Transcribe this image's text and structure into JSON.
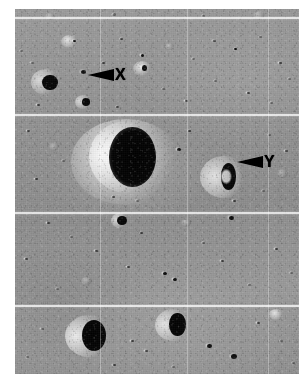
{
  "figure": {
    "kind": "lunar-surface-photograph",
    "tone": "grayscale",
    "background_color": "#ffffff",
    "plate_color": "#8e8e8e",
    "annotation_color": "#000000"
  },
  "annotations": [
    {
      "id": "x",
      "label": "X",
      "icon": "left-arrow-icon",
      "direction": "points-left",
      "target": "small dark crater in upper portion of image",
      "x_pct": 30.5,
      "y_pct": 15.5
    },
    {
      "id": "y",
      "label": "Y",
      "icon": "left-arrow-icon",
      "direction": "points-left",
      "target": "rimmed crater with crescent shadow, right of center",
      "x_pct": 79.0,
      "y_pct": 39.5
    }
  ],
  "seams": {
    "description": "white framelet seam lines from reconstructed orbital film strip",
    "color": "#ffffff",
    "horizontal_y_pct": [
      2.2,
      28.8,
      55.6,
      81.1
    ],
    "vertical_x_pct": [
      30.0,
      60.5,
      89.0
    ]
  },
  "features": {
    "major_craters": [
      {
        "name": "large-shadowed-crater",
        "x_pct": 38,
        "y_pct": 42,
        "size_pct": 25,
        "shadow": "deep-east-interior"
      },
      {
        "name": "crater-y",
        "x_pct": 74,
        "y_pct": 44,
        "size_pct": 16,
        "shadow": "crescent-east"
      },
      {
        "name": "lower-left-crater",
        "x_pct": 25,
        "y_pct": 87,
        "size_pct": 17,
        "shadow": "deep-east-interior"
      },
      {
        "name": "lower-center-crater",
        "x_pct": 51,
        "y_pct": 84,
        "size_pct": 13,
        "shadow": "deep-east-interior"
      },
      {
        "name": "upper-left-crater",
        "x_pct": 12,
        "y_pct": 19,
        "size_pct": 10,
        "shadow": "east-interior"
      },
      {
        "name": "crater-x-target",
        "x_pct": 26,
        "y_pct": 16,
        "size_pct": 4,
        "shadow": "small-pit"
      }
    ]
  }
}
